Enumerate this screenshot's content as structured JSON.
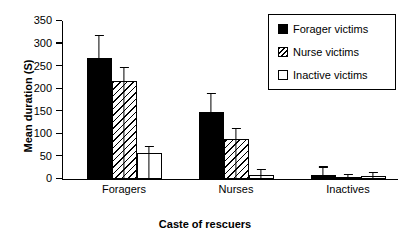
{
  "chart_data": {
    "type": "bar",
    "title": "",
    "xlabel": "Caste of rescuers",
    "ylabel": "Mean duration (S)",
    "categories": [
      "Foragers",
      "Nurses",
      "Inactives"
    ],
    "ylim": [
      0,
      350
    ],
    "yticks": [
      0,
      50,
      100,
      150,
      200,
      250,
      300,
      350
    ],
    "ytick_labels": [
      "0",
      "50",
      "100",
      "150",
      "200",
      "250",
      "300",
      "350"
    ],
    "grid": false,
    "legend_position": "top-right",
    "error_bars": "upper-only",
    "series": [
      {
        "name": "Forager victims",
        "fill": "solid",
        "values": [
          268,
          149,
          8
        ],
        "errors": [
          51,
          42,
          20
        ]
      },
      {
        "name": "Nurse victims",
        "fill": "hatch",
        "values": [
          217,
          89,
          4
        ],
        "errors": [
          31,
          25,
          7
        ]
      },
      {
        "name": "Inactive victims",
        "fill": "white",
        "values": [
          58,
          9,
          6
        ],
        "errors": [
          16,
          13,
          9
        ]
      }
    ]
  },
  "colors": {
    "axis": "#000000",
    "background": "#ffffff",
    "series_solid": "#000000",
    "series_hatch": "#ffffff",
    "series_white": "#ffffff"
  }
}
